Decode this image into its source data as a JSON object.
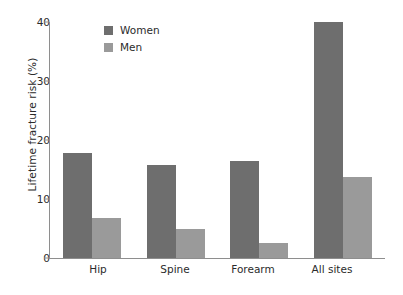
{
  "chart_data": {
    "type": "bar",
    "title": "",
    "subtitle": "",
    "xlabel": "",
    "ylabel": "Lifetime fracture risk (%)",
    "categories": [
      "Hip",
      "Spine",
      "Forearm",
      "All sites"
    ],
    "series": [
      {
        "name": "Women",
        "color": "#6e6e6e",
        "values": [
          17.8,
          15.8,
          16.5,
          40.0
        ]
      },
      {
        "name": "Men",
        "color": "#9a9a9a",
        "values": [
          6.8,
          4.9,
          2.5,
          13.7
        ]
      }
    ],
    "ylim": [
      0,
      40
    ],
    "yticks": [
      0,
      10,
      20,
      30,
      40
    ],
    "ytick_labels": [
      "0",
      "10",
      "20",
      "30",
      "40"
    ],
    "grid": false,
    "legend_position": "top-left",
    "legend_entries": [
      "Women",
      "Men"
    ],
    "annotations": []
  },
  "axes": {
    "y_title": "Lifetime fracture risk (%)",
    "y_tick_labels": [
      "40",
      "30",
      "20",
      "10",
      "0"
    ],
    "x_tick_labels": [
      "Hip",
      "Spine",
      "Forearm",
      "All sites"
    ]
  },
  "legend": {
    "items": [
      {
        "label": "Women",
        "color": "#6e6e6e"
      },
      {
        "label": "Men",
        "color": "#9a9a9a"
      }
    ]
  },
  "colors": {
    "women": "#6e6e6e",
    "men": "#9a9a9a",
    "axis": "#8e8e8e",
    "text": "#2b2b2b",
    "background": "#ffffff"
  }
}
